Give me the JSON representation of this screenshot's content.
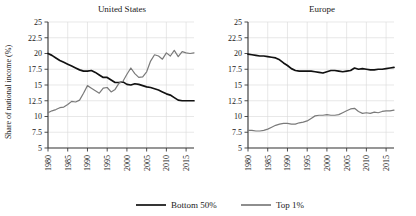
{
  "figure": {
    "ylabel": "Share of national income (%)",
    "legend": [
      {
        "label": "Bottom 50%",
        "color": "#111111"
      },
      {
        "label": "Top 1%",
        "color": "#7a7a7a"
      }
    ]
  },
  "chart_data": [
    {
      "type": "line",
      "title": "United States",
      "xlabel": "",
      "ylabel": "Share of national income (%)",
      "xlim": [
        1980,
        2017
      ],
      "ylim": [
        5,
        25
      ],
      "yticks": [
        5,
        7.5,
        10,
        12.5,
        15,
        17.5,
        20,
        22.5,
        25
      ],
      "ytick_labels": [
        "5",
        "7.5",
        "10",
        "12.5",
        "15",
        "17.5",
        "20",
        "22.5",
        "25"
      ],
      "xticks": [
        1980,
        1985,
        1990,
        1995,
        2000,
        2005,
        2010,
        2015
      ],
      "xtick_labels": [
        "1980",
        "1985",
        "1990",
        "1995",
        "2000",
        "2005",
        "2010",
        "2015"
      ],
      "grid": true,
      "legend_position": "bottom-center-shared",
      "x": [
        1980,
        1981,
        1982,
        1983,
        1984,
        1985,
        1986,
        1987,
        1988,
        1989,
        1990,
        1991,
        1992,
        1993,
        1994,
        1995,
        1996,
        1997,
        1998,
        1999,
        2000,
        2001,
        2002,
        2003,
        2004,
        2005,
        2006,
        2007,
        2008,
        2009,
        2010,
        2011,
        2012,
        2013,
        2014,
        2015,
        2016,
        2017
      ],
      "series": [
        {
          "name": "Bottom 50%",
          "color": "#111111",
          "values": [
            20.0,
            19.7,
            19.3,
            18.9,
            18.6,
            18.3,
            18.0,
            17.7,
            17.4,
            17.2,
            17.2,
            17.3,
            17.0,
            16.6,
            16.2,
            16.2,
            15.8,
            15.4,
            15.4,
            15.5,
            15.1,
            15.0,
            15.2,
            15.1,
            14.9,
            14.7,
            14.6,
            14.4,
            14.2,
            13.9,
            13.6,
            13.4,
            13.0,
            12.6,
            12.5,
            12.5,
            12.5,
            12.5
          ]
        },
        {
          "name": "Top 1%",
          "color": "#7a7a7a",
          "values": [
            10.6,
            10.9,
            11.1,
            11.4,
            11.5,
            11.9,
            12.4,
            12.3,
            12.6,
            13.7,
            14.9,
            14.5,
            14.1,
            13.7,
            14.5,
            14.6,
            13.9,
            14.3,
            15.3,
            15.6,
            16.7,
            17.7,
            16.8,
            16.2,
            16.3,
            17.1,
            18.8,
            19.8,
            19.6,
            19.1,
            20.1,
            19.6,
            20.5,
            19.5,
            20.3,
            20.1,
            20.0,
            20.1
          ]
        }
      ]
    },
    {
      "type": "line",
      "title": "Europe",
      "xlabel": "",
      "ylabel": "",
      "xlim": [
        1980,
        2017
      ],
      "ylim": [
        5,
        25
      ],
      "yticks": [
        5,
        7.5,
        10,
        12.5,
        15,
        17.5,
        20,
        22.5,
        25
      ],
      "ytick_labels": [
        "5",
        "7.5",
        "10",
        "12.5",
        "15",
        "17.5",
        "20",
        "22.5",
        "25"
      ],
      "xticks": [
        1980,
        1985,
        1990,
        1995,
        2000,
        2005,
        2010,
        2015
      ],
      "xtick_labels": [
        "1980",
        "1985",
        "1990",
        "1995",
        "2000",
        "2005",
        "2010",
        "2015"
      ],
      "grid": true,
      "legend_position": "bottom-center-shared",
      "x": [
        1980,
        1981,
        1982,
        1983,
        1984,
        1985,
        1986,
        1987,
        1988,
        1989,
        1990,
        1991,
        1992,
        1993,
        1994,
        1995,
        1996,
        1997,
        1998,
        1999,
        2000,
        2001,
        2002,
        2003,
        2004,
        2005,
        2006,
        2007,
        2008,
        2009,
        2010,
        2011,
        2012,
        2013,
        2014,
        2015,
        2016,
        2017
      ],
      "series": [
        {
          "name": "Bottom 50%",
          "color": "#111111",
          "values": [
            19.9,
            19.8,
            19.7,
            19.6,
            19.6,
            19.5,
            19.4,
            19.3,
            19.0,
            18.5,
            18.1,
            17.6,
            17.3,
            17.2,
            17.2,
            17.2,
            17.2,
            17.1,
            17.0,
            16.9,
            17.1,
            17.3,
            17.3,
            17.2,
            17.1,
            17.2,
            17.3,
            17.7,
            17.5,
            17.6,
            17.5,
            17.4,
            17.4,
            17.5,
            17.5,
            17.6,
            17.7,
            17.8
          ]
        },
        {
          "name": "Top 1%",
          "color": "#7a7a7a",
          "values": [
            7.8,
            7.8,
            7.7,
            7.7,
            7.8,
            8.0,
            8.3,
            8.6,
            8.8,
            8.9,
            8.9,
            8.8,
            8.8,
            9.0,
            9.1,
            9.3,
            9.7,
            10.1,
            10.2,
            10.2,
            10.3,
            10.2,
            10.2,
            10.3,
            10.6,
            10.9,
            11.2,
            11.3,
            10.8,
            10.5,
            10.6,
            10.5,
            10.7,
            10.6,
            10.8,
            10.9,
            10.9,
            11.0
          ]
        }
      ]
    }
  ]
}
